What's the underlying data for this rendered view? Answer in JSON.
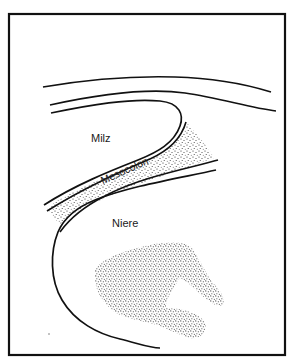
{
  "diagram": {
    "labels": {
      "spleen": "Milz",
      "mesocolon": "Mesocolon",
      "kidney": "Niere"
    },
    "colors": {
      "stroke": "#111111",
      "stipple": "#222222",
      "background": "#ffffff"
    }
  }
}
